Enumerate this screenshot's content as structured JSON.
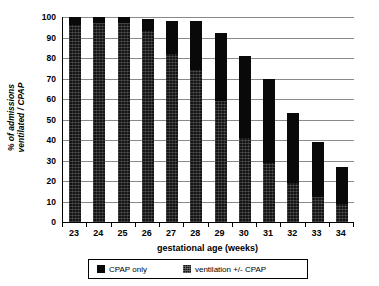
{
  "chart_data": {
    "type": "bar",
    "stacked": true,
    "title": "",
    "xlabel": "gestational age (weeks)",
    "ylabel": "% of admissions\nventilated / CPAP",
    "categories": [
      "23",
      "24",
      "25",
      "26",
      "27",
      "28",
      "29",
      "30",
      "31",
      "32",
      "33",
      "34"
    ],
    "ylim": [
      0,
      100
    ],
    "yticks": [
      0,
      10,
      20,
      30,
      40,
      50,
      60,
      70,
      80,
      90,
      100
    ],
    "ytick_labels": [
      "0",
      "10",
      "20",
      "30",
      "40",
      "50",
      "60",
      "70",
      "80",
      "90",
      "100"
    ],
    "grid": true,
    "legend_position": "bottom",
    "series": [
      {
        "name": "CPAP only",
        "color": "#090909",
        "values": [
          4,
          3,
          3,
          6,
          16,
          24,
          33,
          40,
          41,
          34,
          27,
          18
        ]
      },
      {
        "name": "ventilation +/- CPAP",
        "color": "#141414",
        "values": [
          96,
          97,
          97,
          93,
          82,
          74,
          59,
          41,
          29,
          19,
          12,
          9
        ]
      }
    ],
    "totals": [
      100,
      100,
      100,
      99,
      98,
      98,
      92,
      81,
      70,
      53,
      39,
      27
    ]
  },
  "legend": {
    "items": [
      {
        "label": "CPAP only"
      },
      {
        "label": "ventilation +/- CPAP"
      }
    ]
  }
}
